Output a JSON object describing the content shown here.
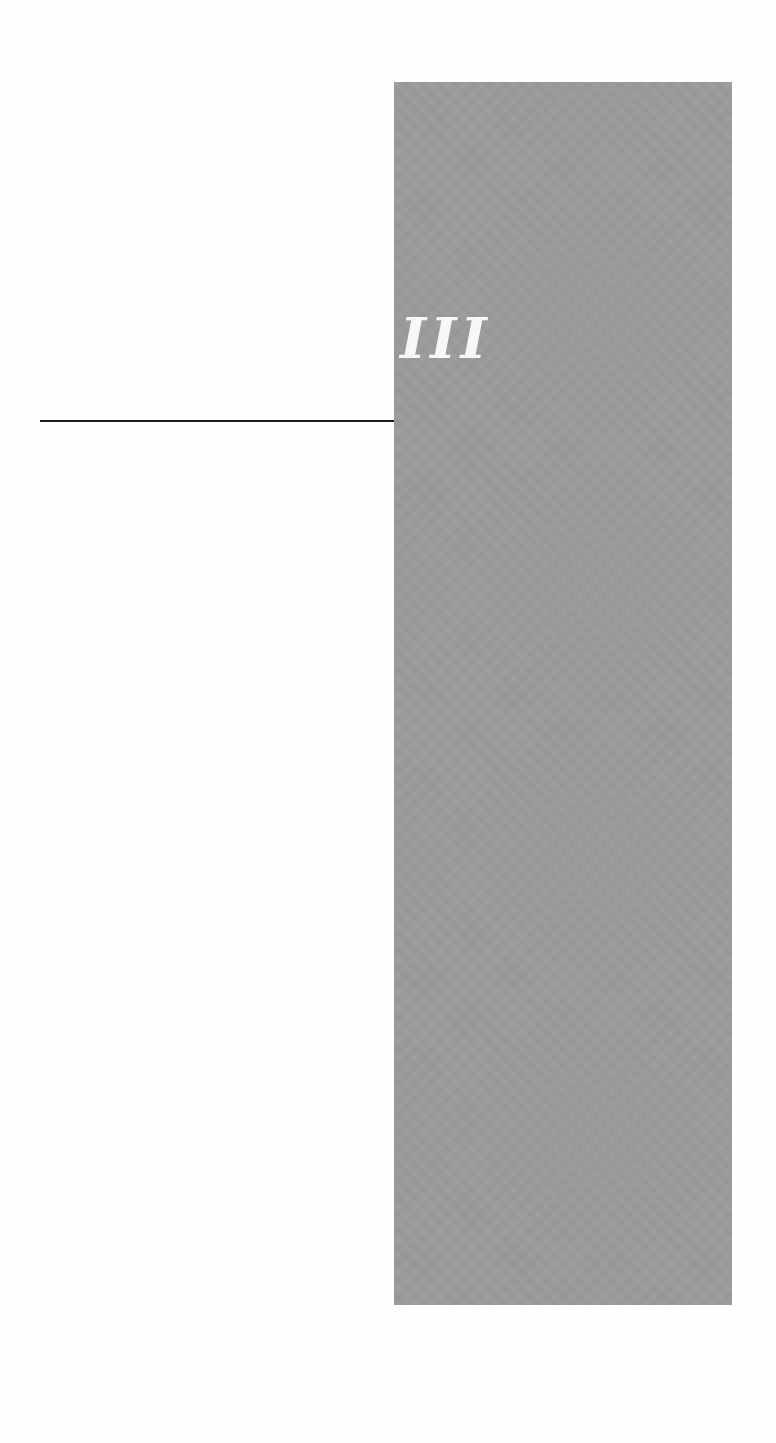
{
  "page": {
    "part_numeral": "III",
    "colors": {
      "background": "#fefefe",
      "panel": "#9c9c9c",
      "numeral": "#f7f7f7",
      "rule": "#1a1a1a"
    }
  }
}
